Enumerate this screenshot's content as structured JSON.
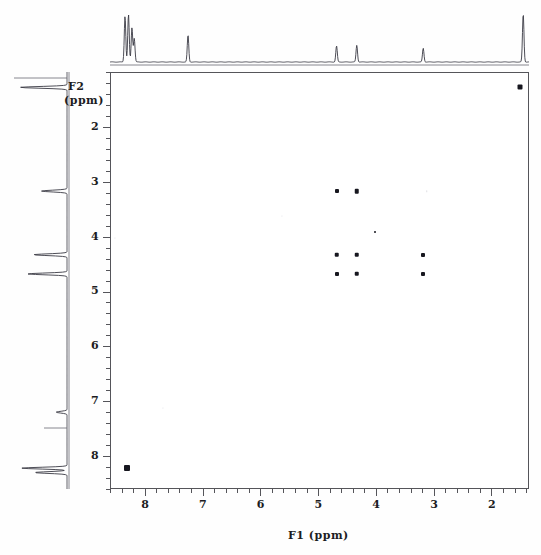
{
  "figure": {
    "type": "2d-nmr-cosy-spectrum",
    "background_color": "#ffffff",
    "frame_color": "#55555a",
    "peak_color": "#17171f"
  },
  "axes": {
    "x": {
      "title": "F1  (ppm)",
      "label_f1": "F1",
      "label_ppm": "(ppm)",
      "ticks": [
        "8",
        "7",
        "6",
        "5",
        "4",
        "3",
        "2"
      ],
      "range": [
        8.6,
        1.35
      ],
      "direction": "reversed",
      "minor_ticks_per_major": 5
    },
    "y": {
      "title_line1": "F2",
      "title_line2": "(ppm)",
      "ticks": [
        "2",
        "3",
        "4",
        "5",
        "6",
        "7",
        "8"
      ],
      "range": [
        1.0,
        8.6
      ],
      "direction": "increasing-downward",
      "minor_ticks_per_major": 5
    }
  },
  "chart_data": {
    "type": "scatter",
    "title": "",
    "xlabel": "F1  (ppm)",
    "ylabel": "F2  (ppm)",
    "xlim": [
      8.6,
      1.35
    ],
    "ylim": [
      8.6,
      1.0
    ],
    "grid": false,
    "legend": "none",
    "x_tick_labels": [
      "8",
      "7",
      "6",
      "5",
      "4",
      "3",
      "2"
    ],
    "y_tick_labels": [
      "2",
      "3",
      "4",
      "5",
      "6",
      "7",
      "8"
    ],
    "cross_peaks": [
      {
        "f1": 4.68,
        "f2": 3.17,
        "size": 4.0,
        "intensity": "strong"
      },
      {
        "f1": 4.33,
        "f2": 3.17,
        "size": 4.5,
        "intensity": "strong"
      },
      {
        "f1": 4.68,
        "f2": 4.33,
        "size": 4.5,
        "intensity": "strong"
      },
      {
        "f1": 4.33,
        "f2": 4.33,
        "size": 4.5,
        "intensity": "strong"
      },
      {
        "f1": 3.18,
        "f2": 4.33,
        "size": 4.0,
        "intensity": "strong"
      },
      {
        "f1": 4.68,
        "f2": 4.68,
        "size": 4.0,
        "intensity": "strong"
      },
      {
        "f1": 4.33,
        "f2": 4.68,
        "size": 4.5,
        "intensity": "strong"
      },
      {
        "f1": 3.18,
        "f2": 4.68,
        "size": 4.0,
        "intensity": "strong"
      },
      {
        "f1": 4.02,
        "f2": 3.92,
        "size": 2.0,
        "intensity": "weak"
      },
      {
        "f1": 8.3,
        "f2": 8.22,
        "size": 6.0,
        "intensity": "strong-diagonal"
      },
      {
        "f1": 1.5,
        "f2": 1.28,
        "size": 5.0,
        "intensity": "strong-diagonal"
      }
    ],
    "faint_artifacts": [
      {
        "f1": 3.12,
        "f2": 3.17,
        "size": 1.5
      },
      {
        "f1": 5.63,
        "f2": 3.62,
        "size": 1.2
      },
      {
        "f1": 7.68,
        "f2": 7.12,
        "size": 1.2
      },
      {
        "f1": 8.52,
        "f2": 4.03,
        "size": 1.2
      }
    ],
    "f1_projection_peaks": [
      {
        "ppm": 8.34,
        "height": 0.94
      },
      {
        "ppm": 8.28,
        "height": 0.97
      },
      {
        "ppm": 8.22,
        "height": 0.7
      },
      {
        "ppm": 8.18,
        "height": 0.48
      },
      {
        "ppm": 7.25,
        "height": 0.55
      },
      {
        "ppm": 4.68,
        "height": 0.33
      },
      {
        "ppm": 4.33,
        "height": 0.34
      },
      {
        "ppm": 3.18,
        "height": 0.28
      },
      {
        "ppm": 1.45,
        "height": 0.98
      }
    ],
    "f2_projection_peaks": [
      {
        "ppm": 1.28,
        "height": 0.95
      },
      {
        "ppm": 3.17,
        "height": 0.52
      },
      {
        "ppm": 4.33,
        "height": 0.68
      },
      {
        "ppm": 4.68,
        "height": 0.8
      },
      {
        "ppm": 7.2,
        "height": 0.22
      },
      {
        "ppm": 8.22,
        "height": 0.92
      },
      {
        "ppm": 8.3,
        "height": 0.66
      }
    ]
  },
  "projections": {
    "top_trace_name": "f1-1d-projection",
    "left_trace_name": "f2-1d-projection"
  }
}
